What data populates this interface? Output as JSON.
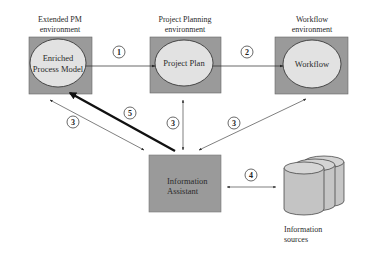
{
  "colors": {
    "box_fill": "#9a9a9a",
    "ellipse_fill": "#e2e2e2",
    "line": "#2a2a2a",
    "cylinder_fill": "#c8c8c8"
  },
  "environments": [
    {
      "id": "extended-pm",
      "title_line1": "Extended PM",
      "title_line2": "environment",
      "inner_line1": "Enriched",
      "inner_line2": "Process Model"
    },
    {
      "id": "project-planning",
      "title_line1": "Project Planning",
      "title_line2": "environment",
      "inner_line1": "Project Plan",
      "inner_line2": ""
    },
    {
      "id": "workflow",
      "title_line1": "Workflow",
      "title_line2": "environment",
      "inner_line1": "Workflow",
      "inner_line2": ""
    }
  ],
  "assistant": {
    "line1": "Information",
    "line2": "Assistant"
  },
  "sources": {
    "line1": "Information",
    "line2": "sources"
  },
  "connections": [
    {
      "label": "1",
      "from": "extended-pm",
      "to": "project-planning",
      "style": "single"
    },
    {
      "label": "2",
      "from": "project-planning",
      "to": "workflow",
      "style": "single"
    },
    {
      "label": "3",
      "from": "assistant",
      "to": "extended-pm",
      "style": "double"
    },
    {
      "label": "3",
      "from": "assistant",
      "to": "project-planning",
      "style": "double"
    },
    {
      "label": "3",
      "from": "assistant",
      "to": "workflow",
      "style": "double"
    },
    {
      "label": "4",
      "from": "sources",
      "to": "assistant",
      "style": "double"
    },
    {
      "label": "5",
      "from": "assistant",
      "to": "extended-pm",
      "style": "bold"
    }
  ]
}
